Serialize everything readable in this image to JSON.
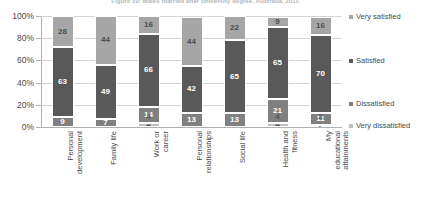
{
  "chart_data": {
    "type": "bar",
    "subtype": "stacked-bar-100-percent",
    "title": "Figure 19: Males married after university degree, Australia, 2011",
    "xlabel": "",
    "ylabel": "",
    "ylim": [
      0,
      100
    ],
    "ytick_labels": [
      "0%",
      "20%",
      "40%",
      "60%",
      "80%",
      "100%"
    ],
    "ytick_values": [
      0,
      20,
      40,
      60,
      80,
      100
    ],
    "grid": true,
    "legend_position": "right",
    "categories": [
      "Personal development",
      "Family life",
      "Work or career",
      "Personal relationships",
      "Social life",
      "Health and fitness",
      "My educational attainments"
    ],
    "series": [
      {
        "name": "Very satisfied",
        "color": "#a6a6a6",
        "values": [
          28,
          44,
          16,
          44,
          22,
          9,
          16
        ]
      },
      {
        "name": "Satisfied",
        "color": "#595959",
        "values": [
          63,
          49,
          66,
          42,
          65,
          65,
          70
        ]
      },
      {
        "name": "Dissatisfied",
        "color": "#808080",
        "values": [
          9,
          7,
          14,
          13,
          13,
          21,
          11
        ]
      },
      {
        "name": "Very dissatisfied",
        "color": "#bfbfbf",
        "values": [
          0,
          0,
          4,
          0,
          0,
          4,
          2
        ]
      }
    ],
    "stack_order_top_to_bottom": [
      "Very satisfied",
      "Satisfied",
      "Dissatisfied",
      "Very dissatisfied"
    ]
  },
  "legend": {
    "items": [
      {
        "label": "Very satisfied",
        "color": "#a6a6a6"
      },
      {
        "label": "Satisfied",
        "color": "#595959"
      },
      {
        "label": "Dissatisfied",
        "color": "#808080"
      },
      {
        "label": "Very dissatisfied",
        "color": "#bfbfbf"
      }
    ]
  }
}
